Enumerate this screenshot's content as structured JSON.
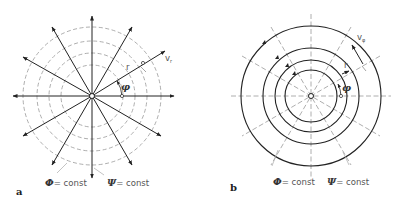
{
  "panels": [
    {
      "id": "a",
      "panel_label": "a",
      "description": "Radial source flow: streamlines are radial rays, equipotentials are dashed concentric circles",
      "vector_label": "v",
      "vector_subscript": "r",
      "radius_label": "r",
      "angle_label": "φ",
      "potential_label_symbol": "Φ",
      "potential_label_text": "= const",
      "stream_label_symbol": "Ψ",
      "stream_label_text": "= const"
    },
    {
      "id": "b",
      "panel_label": "b",
      "description": "Potential vortex: streamlines are solid concentric circles with arrows, equipotentials are dashed radial rays",
      "vector_label": "v",
      "vector_subscript": "φ",
      "radius_label": "r",
      "angle_label": "φ",
      "potential_label_symbol": "Φ",
      "potential_label_text": "= const",
      "stream_label_symbol": "Ψ",
      "stream_label_text": "= const"
    }
  ],
  "colors": {
    "line": "#222222",
    "dashed": "#888888",
    "text": "#555555"
  }
}
